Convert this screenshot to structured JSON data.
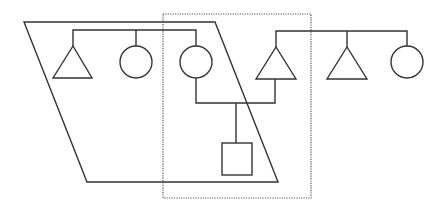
{
  "diagram": {
    "type": "pedigree / kinship diagram",
    "colors": {
      "line": "#333333",
      "background": "#ffffff",
      "dotted_box": "#555555"
    },
    "left_family": {
      "members": [
        {
          "symbol": "triangle",
          "meaning": "person (unspecified sex)"
        },
        {
          "symbol": "circle",
          "meaning": "female"
        },
        {
          "symbol": "circle",
          "meaning": "female"
        }
      ]
    },
    "right_family": {
      "members": [
        {
          "symbol": "triangle",
          "meaning": "person (unspecified sex)"
        },
        {
          "symbol": "triangle",
          "meaning": "person (unspecified sex)"
        },
        {
          "symbol": "circle",
          "meaning": "female"
        }
      ]
    },
    "couple": {
      "partners": [
        "left_family circle 3",
        "right_family triangle 1"
      ]
    },
    "child": {
      "symbol": "square",
      "meaning": "male"
    },
    "enclosures": [
      {
        "shape": "parallelogram",
        "style": "solid",
        "encloses": "left family sibship and child"
      },
      {
        "shape": "rectangle",
        "style": "dotted",
        "encloses": "couple and child"
      }
    ]
  }
}
